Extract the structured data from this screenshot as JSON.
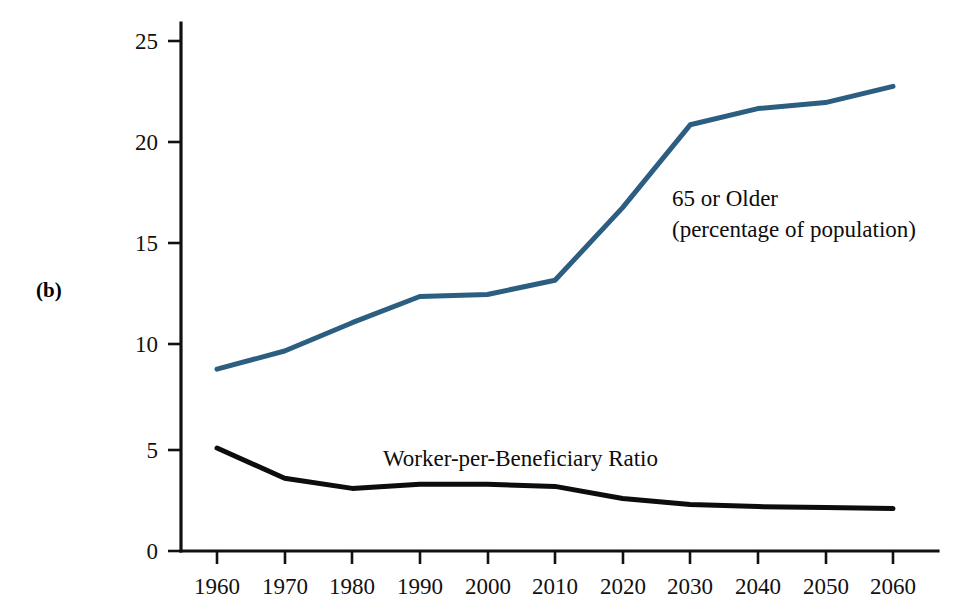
{
  "figure": {
    "panel_label": "(b)"
  },
  "chart_data": {
    "type": "line",
    "title": "",
    "subtitle": "",
    "xlabel": "",
    "ylabel": "",
    "grid": false,
    "legend_position": "inline-annotation",
    "categories": [
      "1960",
      "1970",
      "1980",
      "1990",
      "2000",
      "2010",
      "2020",
      "2030",
      "2040",
      "2050",
      "2060"
    ],
    "x": [
      1960,
      1970,
      1980,
      1990,
      2000,
      2010,
      2020,
      2030,
      2040,
      2050,
      2060
    ],
    "xlim": [
      1960,
      2060
    ],
    "ylim": [
      0,
      25
    ],
    "y_ticks": [
      "0",
      "5",
      "10",
      "15",
      "20",
      "25"
    ],
    "y_tick_values": [
      0,
      5,
      10,
      15,
      20,
      25
    ],
    "x_ticks": [
      "1960",
      "1970",
      "1980",
      "1990",
      "2000",
      "2010",
      "2020",
      "2030",
      "2040",
      "2050",
      "2060"
    ],
    "series": [
      {
        "name": "65 or Older",
        "label_line1": "65 or Older",
        "label_line2": "(percentage of population)",
        "color": "#2b5e80",
        "values": [
          9.0,
          9.9,
          11.3,
          12.6,
          12.7,
          13.4,
          17.0,
          21.1,
          21.9,
          22.2,
          23.0
        ]
      },
      {
        "name": "Worker-per-Beneficiary Ratio",
        "label_line1": "Worker-per-Beneficiary Ratio",
        "label_line2": "",
        "color": "#0d0d0d",
        "values": [
          5.1,
          3.6,
          3.1,
          3.3,
          3.3,
          3.2,
          2.6,
          2.3,
          2.2,
          2.15,
          2.1
        ]
      }
    ],
    "annotations": [
      {
        "name": "older-population-label",
        "text_line1": "65 or Older",
        "text_line2": "(percentage of population)",
        "x_px": 672,
        "y_px": 206
      },
      {
        "name": "worker-ratio-label",
        "text": "Worker-per-Beneficiary Ratio",
        "x_px": 383,
        "y_px": 466
      }
    ]
  }
}
